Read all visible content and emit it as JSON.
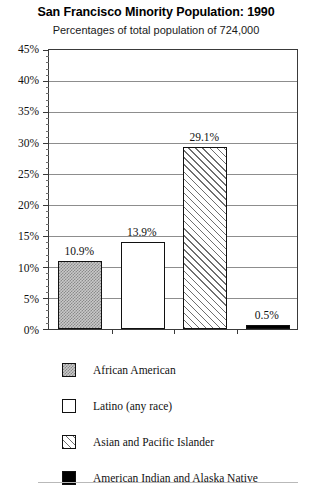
{
  "chart_data": {
    "type": "bar",
    "title": "San Francisco Minority Population: 1990",
    "subtitle": "Percentages of total population of 724,000",
    "xlabel": "",
    "ylabel": "",
    "ylim": [
      0,
      45
    ],
    "ytick_step": 5,
    "yminor_step": 1,
    "grid": true,
    "yunit": "%",
    "legend_position": "below",
    "categories": [
      "African American",
      "Latino (any race)",
      "Asian and Pacific Islander",
      "American Indian and Alaska Native"
    ],
    "values": [
      10.9,
      13.9,
      29.1,
      0.5
    ],
    "data_labels": [
      "10.9%",
      "13.9%",
      "29.1%",
      "0.5%"
    ],
    "ytick_labels": [
      "0%",
      "5%",
      "10%",
      "15%",
      "20%",
      "25%",
      "30%",
      "35%",
      "40%",
      "45%"
    ],
    "ytick_values": [
      0,
      5,
      10,
      15,
      20,
      25,
      30,
      35,
      40,
      45
    ],
    "series_styles": [
      "dotted-gray",
      "white",
      "diagonal-hatch",
      "solid-black"
    ]
  },
  "legend": {
    "items": [
      {
        "label": "African American",
        "style": "dotted-gray"
      },
      {
        "label": "Latino (any race)",
        "style": "white"
      },
      {
        "label": "Asian and Pacific Islander",
        "style": "diagonal-hatch"
      },
      {
        "label": "American Indian and Alaska Native",
        "style": "solid-black"
      }
    ]
  },
  "colors": {
    "axis": "#3a3a3a",
    "grid": "#8d8d8d",
    "text": "#111111",
    "bar_gray": "#c9c9c9",
    "bar_black": "#000000",
    "bar_white": "#ffffff",
    "hatch": "#6f6f6f"
  }
}
